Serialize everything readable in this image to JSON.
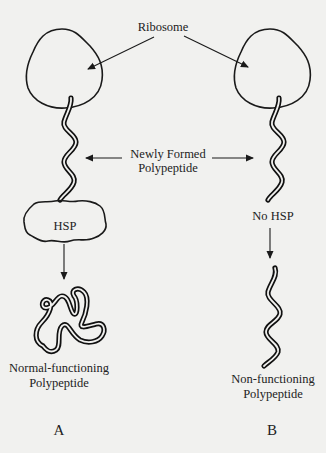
{
  "diagram": {
    "labels": {
      "ribosome": "Ribosome",
      "newly_formed_line1": "Newly Formed",
      "newly_formed_line2": "Polypeptide",
      "hsp": "HSP",
      "no_hsp": "No HSP",
      "normal_line1": "Normal-functioning",
      "normal_line2": "Polypeptide",
      "non_line1": "Non-functioning",
      "non_line2": "Polypeptide",
      "panel_a": "A",
      "panel_b": "B"
    },
    "panels": [
      {
        "id": "A",
        "has_hsp": true,
        "outcome": "Normal-functioning Polypeptide"
      },
      {
        "id": "B",
        "has_hsp": false,
        "outcome": "Non-functioning Polypeptide"
      }
    ],
    "colors": {
      "background": "#f1f1ef",
      "ink": "#1a1a1a"
    }
  }
}
